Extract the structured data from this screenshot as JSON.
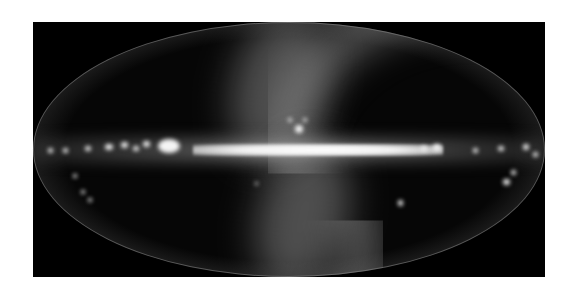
{
  "image": {
    "subject": "all-sky infrared map",
    "projection": "Mollweide (elliptical)",
    "description": "Full-sky view in galactic coordinates showing the bright Milky Way plane as a horizontal band, with an S-shaped zodiacal light band crossing it diagonally; Large Magellanic Cloud visible as a small blob lower right.",
    "colors": {
      "page_background": "#ffffff",
      "frame_background": "#000000",
      "plane_core": "#f4f4f4",
      "zodiacal_band": "#8c8c8c"
    },
    "features": [
      {
        "name": "galactic-plane",
        "label": "Galactic plane"
      },
      {
        "name": "galactic-center",
        "label": "Galactic center bulge"
      },
      {
        "name": "zodiacal-band",
        "label": "Zodiacal light"
      },
      {
        "name": "rho-ophiuchi-cloud",
        "label": "Bright cloud above center"
      },
      {
        "name": "cygnus-region",
        "label": "Bright region left of center"
      },
      {
        "name": "lmc",
        "label": "Large Magellanic Cloud"
      }
    ]
  }
}
